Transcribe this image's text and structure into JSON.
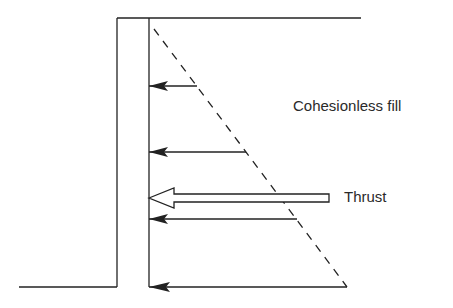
{
  "diagram": {
    "labels": {
      "fill": "Cohesionless fill",
      "thrust": "Thrust"
    },
    "colors": {
      "line": "#222222",
      "background": "#ffffff"
    },
    "pressure_arrows_y": [
      86,
      152,
      198,
      287
    ],
    "thrust_arrow_y": 177
  }
}
